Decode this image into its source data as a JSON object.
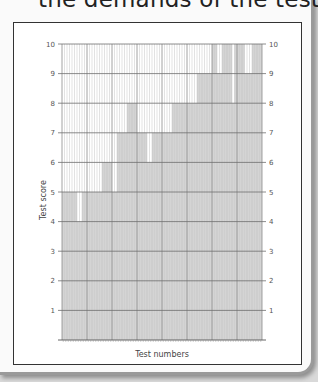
{
  "heading": "the demands of the tests.",
  "chart_data": {
    "type": "bar",
    "title": "",
    "xlabel": "Test numbers",
    "ylabel": "Test score",
    "ylim": [
      0,
      10
    ],
    "yticks": [
      1,
      2,
      3,
      4,
      5,
      6,
      7,
      8,
      9,
      10
    ],
    "grid": true,
    "legend": "none",
    "bar_color": "#d4d4d4",
    "categories": [
      1,
      2,
      3,
      4,
      5,
      6,
      7,
      8,
      9,
      10,
      11,
      12,
      13,
      14,
      15,
      16,
      17,
      18,
      19,
      20,
      21,
      22,
      23,
      24,
      25,
      26,
      27,
      28,
      29,
      30,
      31,
      32,
      33,
      34,
      35,
      36,
      37,
      38,
      39,
      40,
      41,
      42,
      43,
      44,
      45,
      46,
      47,
      48,
      49,
      50,
      51,
      52,
      53,
      54,
      55,
      56,
      57,
      58,
      59,
      60,
      61,
      62,
      63,
      64,
      65,
      66,
      67,
      68,
      69,
      70,
      71,
      72,
      73,
      74,
      75,
      76,
      77,
      78,
      79,
      80
    ],
    "values": [
      5,
      5,
      5,
      5,
      5,
      5,
      4,
      4,
      5,
      5,
      5,
      5,
      5,
      5,
      5,
      5,
      6,
      6,
      6,
      6,
      5,
      5,
      7,
      7,
      7,
      7,
      8,
      8,
      8,
      8,
      7,
      7,
      7,
      7,
      6,
      6,
      7,
      7,
      7,
      7,
      7,
      7,
      7,
      7,
      8,
      8,
      8,
      8,
      8,
      8,
      8,
      8,
      8,
      8,
      9,
      9,
      9,
      9,
      9,
      9,
      10,
      10,
      9,
      9,
      10,
      10,
      10,
      10,
      8,
      10,
      10,
      10,
      10,
      9,
      9,
      9,
      10,
      10,
      10,
      10
    ]
  }
}
